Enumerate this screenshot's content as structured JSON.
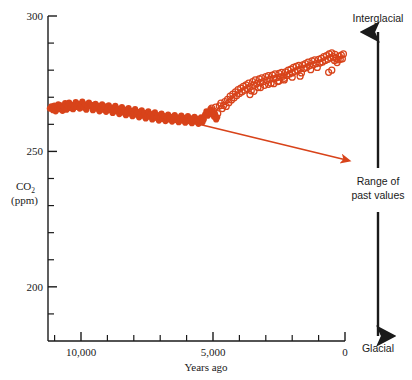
{
  "chart_data": {
    "type": "scatter",
    "title": "",
    "xlabel": "Years ago",
    "ylabel": "CO2 (ppm)",
    "ylabel_main": "CO",
    "ylabel_sub": "2",
    "ylabel_units": "(ppm)",
    "xlim": [
      11250,
      0
    ],
    "ylim": [
      180,
      300
    ],
    "x_axis_reversed": true,
    "grid": false,
    "legend": null,
    "y_ticks_major": [
      300,
      250,
      200
    ],
    "y_tick_labels": [
      "300",
      "250",
      "200"
    ],
    "y_ticks_minor": [
      290,
      280,
      270,
      260,
      240,
      230,
      220,
      210,
      190
    ],
    "x_ticks_major": [
      10000,
      5000,
      0
    ],
    "x_tick_labels": [
      "10,000",
      "5,000",
      "0"
    ],
    "x_ticks_minor": [
      11000,
      9000,
      8000,
      7000,
      6000,
      4000,
      3000,
      2000,
      1000
    ],
    "marker_color": "#D8431A",
    "axis_color": "#1a1a1a",
    "series": [
      {
        "name": "ice-core-filled",
        "marker": "filled-circle",
        "color": "#D8431A",
        "points": [
          [
            11180,
            265.8
          ],
          [
            11120,
            266.6
          ],
          [
            11060,
            265.2
          ],
          [
            11010,
            266.9
          ],
          [
            10960,
            264.8
          ],
          [
            10900,
            266.2
          ],
          [
            10860,
            267.4
          ],
          [
            10810,
            265.6
          ],
          [
            10760,
            267.0
          ],
          [
            10700,
            265.0
          ],
          [
            10650,
            266.4
          ],
          [
            10600,
            267.8
          ],
          [
            10550,
            265.4
          ],
          [
            10500,
            266.8
          ],
          [
            10450,
            268.0
          ],
          [
            10400,
            266.0
          ],
          [
            10350,
            267.2
          ],
          [
            10300,
            265.6
          ],
          [
            10250,
            266.6
          ],
          [
            10200,
            268.2
          ],
          [
            10150,
            266.4
          ],
          [
            10100,
            267.6
          ],
          [
            10050,
            265.8
          ],
          [
            10000,
            267.0
          ],
          [
            9950,
            268.4
          ],
          [
            9900,
            266.2
          ],
          [
            9850,
            267.4
          ],
          [
            9800,
            265.4
          ],
          [
            9750,
            266.8
          ],
          [
            9700,
            268.0
          ],
          [
            9650,
            266.6
          ],
          [
            9600,
            267.2
          ],
          [
            9550,
            265.2
          ],
          [
            9500,
            266.4
          ],
          [
            9450,
            267.6
          ],
          [
            9400,
            265.8
          ],
          [
            9350,
            266.8
          ],
          [
            9300,
            264.8
          ],
          [
            9250,
            266.0
          ],
          [
            9200,
            267.4
          ],
          [
            9150,
            265.4
          ],
          [
            9100,
            266.6
          ],
          [
            9050,
            264.6
          ],
          [
            9000,
            265.8
          ],
          [
            8950,
            267.0
          ],
          [
            8900,
            265.2
          ],
          [
            8850,
            266.2
          ],
          [
            8800,
            264.2
          ],
          [
            8750,
            265.6
          ],
          [
            8700,
            266.8
          ],
          [
            8650,
            264.8
          ],
          [
            8600,
            265.8
          ],
          [
            8550,
            263.8
          ],
          [
            8500,
            265.0
          ],
          [
            8450,
            266.4
          ],
          [
            8400,
            264.4
          ],
          [
            8350,
            265.4
          ],
          [
            8300,
            263.4
          ],
          [
            8250,
            264.6
          ],
          [
            8200,
            266.0
          ],
          [
            8150,
            264.0
          ],
          [
            8100,
            265.0
          ],
          [
            8050,
            263.0
          ],
          [
            8000,
            264.2
          ],
          [
            7950,
            265.6
          ],
          [
            7900,
            263.6
          ],
          [
            7850,
            264.6
          ],
          [
            7800,
            262.6
          ],
          [
            7750,
            263.8
          ],
          [
            7700,
            265.2
          ],
          [
            7650,
            263.2
          ],
          [
            7600,
            264.2
          ],
          [
            7550,
            262.2
          ],
          [
            7500,
            263.4
          ],
          [
            7450,
            264.8
          ],
          [
            7400,
            262.8
          ],
          [
            7350,
            263.8
          ],
          [
            7300,
            261.8
          ],
          [
            7250,
            263.0
          ],
          [
            7200,
            264.4
          ],
          [
            7150,
            262.4
          ],
          [
            7100,
            263.4
          ],
          [
            7050,
            261.4
          ],
          [
            7000,
            262.6
          ],
          [
            6950,
            264.0
          ],
          [
            6900,
            262.0
          ],
          [
            6850,
            263.0
          ],
          [
            6800,
            261.2
          ],
          [
            6750,
            262.4
          ],
          [
            6700,
            263.6
          ],
          [
            6650,
            261.8
          ],
          [
            6600,
            262.8
          ],
          [
            6550,
            261.0
          ],
          [
            6500,
            262.2
          ],
          [
            6450,
            263.4
          ],
          [
            6400,
            261.6
          ],
          [
            6350,
            262.6
          ],
          [
            6300,
            260.8
          ],
          [
            6250,
            262.0
          ],
          [
            6200,
            263.2
          ],
          [
            6150,
            261.4
          ],
          [
            6100,
            262.4
          ],
          [
            6050,
            260.6
          ],
          [
            6000,
            261.8
          ],
          [
            5950,
            263.0
          ],
          [
            5900,
            261.2
          ],
          [
            5850,
            262.2
          ],
          [
            5800,
            260.4
          ],
          [
            5750,
            261.6
          ],
          [
            5700,
            262.8
          ],
          [
            5650,
            261.0
          ],
          [
            5600,
            262.0
          ],
          [
            5550,
            260.2
          ],
          [
            5500,
            261.4
          ],
          [
            5450,
            262.6
          ],
          [
            5400,
            260.8
          ],
          [
            5350,
            261.8
          ],
          [
            5300,
            263.6
          ],
          [
            5250,
            264.8
          ],
          [
            5200,
            263.2
          ],
          [
            5150,
            264.4
          ],
          [
            5100,
            265.6
          ],
          [
            5050,
            263.8
          ],
          [
            5000,
            264.6
          ],
          [
            4960,
            262.8
          ],
          [
            4920,
            263.8
          ],
          [
            4880,
            261.8
          ],
          [
            4840,
            262.6
          ]
        ]
      },
      {
        "name": "ice-core-open",
        "marker": "open-circle",
        "color": "#D8431A",
        "points": [
          [
            5050,
            266.0
          ],
          [
            4980,
            265.0
          ],
          [
            4900,
            266.4
          ],
          [
            4820,
            264.0
          ],
          [
            4760,
            266.8
          ],
          [
            4700,
            267.8
          ],
          [
            4650,
            265.8
          ],
          [
            4600,
            267.0
          ],
          [
            4550,
            268.4
          ],
          [
            4500,
            266.6
          ],
          [
            4450,
            269.2
          ],
          [
            4400,
            268.0
          ],
          [
            4350,
            270.4
          ],
          [
            4300,
            269.0
          ],
          [
            4250,
            271.2
          ],
          [
            4200,
            269.8
          ],
          [
            4150,
            272.0
          ],
          [
            4100,
            270.6
          ],
          [
            4050,
            272.8
          ],
          [
            4000,
            271.4
          ],
          [
            3950,
            273.4
          ],
          [
            3900,
            272.0
          ],
          [
            3850,
            274.0
          ],
          [
            3800,
            272.6
          ],
          [
            3750,
            274.6
          ],
          [
            3700,
            273.2
          ],
          [
            3650,
            275.2
          ],
          [
            3600,
            273.8
          ],
          [
            3550,
            272.4
          ],
          [
            3500,
            275.8
          ],
          [
            3450,
            274.4
          ],
          [
            3400,
            276.4
          ],
          [
            3350,
            275.0
          ],
          [
            3300,
            273.6
          ],
          [
            3250,
            276.8
          ],
          [
            3200,
            275.4
          ],
          [
            3150,
            277.2
          ],
          [
            3100,
            275.8
          ],
          [
            3050,
            274.4
          ],
          [
            3000,
            277.6
          ],
          [
            2950,
            276.2
          ],
          [
            2900,
            278.0
          ],
          [
            2850,
            276.6
          ],
          [
            2800,
            275.2
          ],
          [
            2750,
            278.2
          ],
          [
            2700,
            276.8
          ],
          [
            2650,
            278.6
          ],
          [
            2600,
            277.2
          ],
          [
            2550,
            275.8
          ],
          [
            2500,
            278.8
          ],
          [
            2450,
            277.4
          ],
          [
            2400,
            279.2
          ],
          [
            2350,
            277.8
          ],
          [
            2300,
            276.4
          ],
          [
            2250,
            279.4
          ],
          [
            2200,
            278.0
          ],
          [
            2150,
            280.0
          ],
          [
            2100,
            278.6
          ],
          [
            2050,
            280.4
          ],
          [
            2000,
            279.0
          ],
          [
            1950,
            281.0
          ],
          [
            1900,
            279.6
          ],
          [
            1850,
            281.4
          ],
          [
            1800,
            280.0
          ],
          [
            1750,
            281.8
          ],
          [
            1700,
            280.4
          ],
          [
            1650,
            279.0
          ],
          [
            1600,
            282.0
          ],
          [
            1550,
            280.6
          ],
          [
            1500,
            282.4
          ],
          [
            1450,
            281.0
          ],
          [
            1400,
            283.0
          ],
          [
            1350,
            281.6
          ],
          [
            1300,
            280.2
          ],
          [
            1250,
            283.4
          ],
          [
            1200,
            282.0
          ],
          [
            1150,
            283.8
          ],
          [
            1100,
            282.4
          ],
          [
            1050,
            281.0
          ],
          [
            1000,
            284.0
          ],
          [
            950,
            282.6
          ],
          [
            900,
            284.4
          ],
          [
            850,
            283.0
          ],
          [
            800,
            285.0
          ],
          [
            750,
            283.6
          ],
          [
            700,
            285.4
          ],
          [
            650,
            284.0
          ],
          [
            600,
            286.0
          ],
          [
            550,
            284.6
          ],
          [
            500,
            286.4
          ],
          [
            450,
            285.0
          ],
          [
            400,
            283.6
          ],
          [
            380,
            285.8
          ],
          [
            340,
            284.4
          ],
          [
            300,
            282.8
          ],
          [
            260,
            283.8
          ],
          [
            220,
            285.2
          ],
          [
            180,
            284.0
          ],
          [
            140,
            285.6
          ],
          [
            100,
            284.2
          ],
          [
            60,
            286.0
          ],
          [
            3600,
            271.0
          ],
          [
            3450,
            272.2
          ],
          [
            3200,
            273.6
          ],
          [
            2900,
            274.8
          ],
          [
            2700,
            275.0
          ],
          [
            2500,
            276.0
          ],
          [
            2300,
            277.0
          ],
          [
            2000,
            277.4
          ],
          [
            1700,
            277.8
          ],
          [
            500,
            280.0
          ],
          [
            620,
            279.2
          ]
        ]
      }
    ],
    "annotations": [
      {
        "name": "trend-arrow",
        "type": "arrow",
        "color": "#D8431A",
        "from_x": 6150,
        "from_y": 261.5,
        "to_x": 25,
        "to_y": 247.0
      }
    ]
  },
  "side_scale": {
    "top_label": "Interglacial",
    "middle_label_line1": "Range of",
    "middle_label_line2": "past values",
    "bottom_label": "Glacial",
    "arrow_color": "#1a1a1a"
  }
}
